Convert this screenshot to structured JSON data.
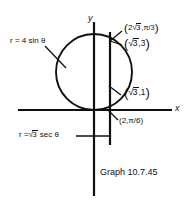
{
  "figure": {
    "caption": "Graph 10.7.45",
    "background_color": "#ffffff",
    "stroke_color": "#101010"
  },
  "axes": {
    "x_label": "x",
    "y_label": "y",
    "origin_px": [
      94,
      110
    ],
    "x_axis_span_px": [
      18,
      172
    ],
    "y_axis_span_px": [
      22,
      196
    ]
  },
  "curves": {
    "circle": {
      "equation_label": "r = 4 sin θ",
      "center_px": [
        94,
        72
      ],
      "radius_px": 38
    },
    "vertical_line": {
      "equation_label_prefix": "r =",
      "equation_label_radicand": "3",
      "equation_label_suffix": "sec θ",
      "x_px": 110,
      "y_span_px": [
        32,
        145
      ]
    }
  },
  "annotations": {
    "point_top": {
      "open_paren": "(",
      "coef": "2",
      "radicand": "3",
      "rest": ",π/3",
      "close_paren": ")"
    },
    "point_second": {
      "open_paren": "(",
      "coef": "",
      "radicand": "3",
      "rest": ",3",
      "close_paren": ")"
    },
    "point_third": {
      "open_paren": "(",
      "coef": "",
      "radicand": "3",
      "rest": ",1",
      "close_paren": ")"
    },
    "point_origin": {
      "text": "(2,π/6)"
    },
    "curve_label": {
      "text": "r = 4 sin θ"
    }
  }
}
